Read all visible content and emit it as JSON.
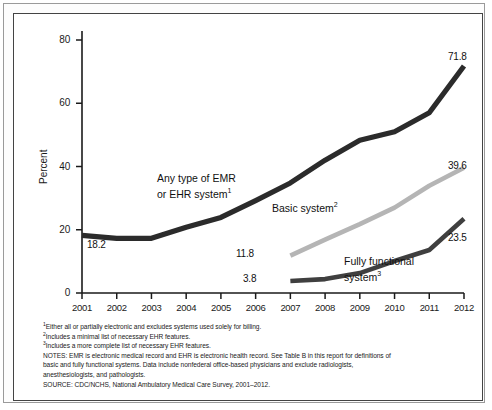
{
  "figure": {
    "y_axis_title": "Percent",
    "y_ticks": [
      "0",
      "20",
      "40",
      "60",
      "80"
    ],
    "x_ticks": [
      "2001",
      "2002",
      "2003",
      "2004",
      "2005",
      "2006",
      "2007",
      "2008",
      "2009",
      "2010",
      "2011",
      "2012"
    ],
    "series_labels": {
      "any_emr_line1": "Any type of EMR",
      "any_emr_line2": "or EHR system",
      "any_emr_sup": "1",
      "basic": "Basic system",
      "basic_sup": "2",
      "fully_line1": "Fully functional",
      "fully_line2": "system",
      "fully_sup": "3"
    },
    "value_labels": {
      "any_emr_start": "18.2",
      "any_emr_end": "71.8",
      "basic_start": "11.8",
      "basic_end": "39.6",
      "fully_start": "3.8",
      "fully_end": "23.5"
    },
    "colors": {
      "any_emr": "#2b2b2b",
      "basic": "#b5b5b5",
      "fully": "#3f3f3f",
      "axis": "#1a1a1a"
    }
  },
  "notes": {
    "footnote1_sup": "1",
    "footnote1": "Either all or partially electronic and excludes systems used solely for billing.",
    "footnote2_sup": "2",
    "footnote2": "Includes a minimal list of necessary EHR features.",
    "footnote3_sup": "3",
    "footnote3": "Includes a more complete list of necessary EHR features.",
    "notes_line1": "NOTES: EMR is electronic medical record and EHR is electronic health record. See Table B in this report for definitions of",
    "notes_line2": "basic and fully functional systems. Data include nonfederal office-based physicians and exclude radiologists,",
    "notes_line3": "anesthesiologists, and pathologists.",
    "source": "SOURCE: CDC/NCHS, National Ambulatory Medical Care Survey, 2001–2012."
  },
  "chart_data": {
    "type": "line",
    "title": "",
    "xlabel": "",
    "ylabel": "Percent",
    "x": [
      2001,
      2002,
      2003,
      2004,
      2005,
      2006,
      2007,
      2008,
      2009,
      2010,
      2011,
      2012
    ],
    "xlim": [
      2001,
      2012
    ],
    "ylim": [
      0,
      80
    ],
    "yticks": [
      0,
      20,
      40,
      60,
      80
    ],
    "grid": false,
    "legend": "inline-annotations",
    "series": [
      {
        "name": "Any type of EMR or EHR system",
        "color": "#2b2b2b",
        "x": [
          2001,
          2002,
          2003,
          2004,
          2005,
          2006,
          2007,
          2008,
          2009,
          2010,
          2011,
          2012
        ],
        "values": [
          18.2,
          17.3,
          17.3,
          20.8,
          23.9,
          29.2,
          34.8,
          42.0,
          48.3,
          51.0,
          57.0,
          71.8
        ],
        "label_start": 18.2,
        "label_end": 71.8
      },
      {
        "name": "Basic system",
        "color": "#b5b5b5",
        "x": [
          2007,
          2008,
          2009,
          2010,
          2011,
          2012
        ],
        "values": [
          11.8,
          16.9,
          21.8,
          27.0,
          33.9,
          39.6
        ],
        "label_start": 11.8,
        "label_end": 39.6
      },
      {
        "name": "Fully functional system",
        "color": "#3f3f3f",
        "x": [
          2007,
          2008,
          2009,
          2010,
          2011,
          2012
        ],
        "values": [
          3.8,
          4.4,
          6.3,
          10.1,
          13.6,
          23.5
        ],
        "label_start": 3.8,
        "label_end": 23.5
      }
    ]
  }
}
